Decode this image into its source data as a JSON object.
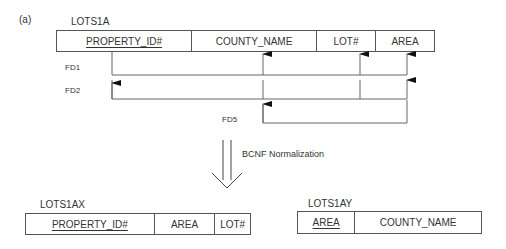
{
  "figure_label": "(a)",
  "source_relation": {
    "name": "LOTS1A",
    "attributes": [
      {
        "label": "PROPERTY_ID#",
        "key": true
      },
      {
        "label": "COUNTY_NAME",
        "key": false
      },
      {
        "label": "LOT#",
        "key": false
      },
      {
        "label": "AREA",
        "key": false
      }
    ]
  },
  "functional_dependencies": [
    {
      "label": "FD1",
      "from": [
        "PROPERTY_ID#"
      ],
      "to": [
        "COUNTY_NAME",
        "LOT#",
        "AREA"
      ]
    },
    {
      "label": "FD2",
      "from": [
        "COUNTY_NAME",
        "LOT#"
      ],
      "to": [
        "PROPERTY_ID#",
        "AREA"
      ]
    },
    {
      "label": "FD5",
      "from": [
        "AREA"
      ],
      "to": [
        "COUNTY_NAME"
      ]
    }
  ],
  "transformation": {
    "label": "BCNF Normalization"
  },
  "result_relations": [
    {
      "name": "LOTS1AX",
      "attributes": [
        {
          "label": "PROPERTY_ID#",
          "key": true
        },
        {
          "label": "AREA",
          "key": false
        },
        {
          "label": "LOT#",
          "key": false
        }
      ]
    },
    {
      "name": "LOTS1AY",
      "attributes": [
        {
          "label": "AREA",
          "key": true
        },
        {
          "label": "COUNTY_NAME",
          "key": false
        }
      ]
    }
  ]
}
